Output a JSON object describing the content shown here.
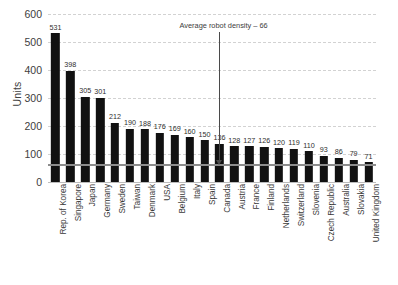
{
  "chart_data": {
    "type": "bar",
    "title": "",
    "xlabel": "",
    "ylabel": "Units",
    "ylim": [
      0,
      600
    ],
    "yticks": [
      0,
      100,
      200,
      300,
      400,
      500,
      600
    ],
    "grid": true,
    "legend": "none",
    "categories": [
      "Rep. of Korea",
      "Singapore",
      "Japan",
      "Germany",
      "Sweden",
      "Taiwan",
      "Denmark",
      "USA",
      "Belgium",
      "Italy",
      "Spain",
      "Canada",
      "Austria",
      "France",
      "Finland",
      "Netherlands",
      "Switzerland",
      "Slovenia",
      "Czech Republic",
      "Australia",
      "Slovakia",
      "United Kingdom"
    ],
    "values": [
      531,
      398,
      305,
      301,
      212,
      190,
      188,
      176,
      169,
      160,
      150,
      136,
      128,
      127,
      126,
      120,
      119,
      110,
      93,
      86,
      79,
      71
    ],
    "annotations": [
      {
        "text": "Average robot density – 66",
        "value": 66,
        "points_to": "Canada"
      }
    ],
    "reference_line": {
      "label": "Average robot density",
      "value": 66,
      "color": "#8c8c8c"
    },
    "colors": {
      "bar": "#111111",
      "gridline": "#d2d2d2",
      "axis_text": "#404040",
      "reference_line": "#8c8c8c",
      "annotation": "#4a4a4a"
    }
  }
}
